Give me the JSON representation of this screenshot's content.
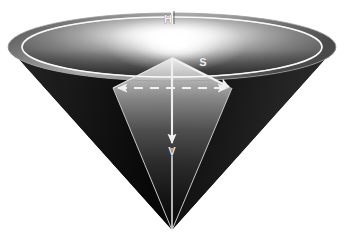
{
  "figure": {
    "background_color": "#ffffff",
    "width": 347,
    "height": 242
  },
  "labels": {
    "height_label": "H",
    "slant_label": "S",
    "vertical_label": "V"
  },
  "annotations": [
    {
      "name": "rim-diameter-marker",
      "label": "H",
      "kind": "tick-mark",
      "x": 172,
      "y": 20
    },
    {
      "name": "slant-arrow",
      "label": "S",
      "kind": "arrow",
      "from": [
        172,
        58
      ],
      "to": [
        232,
        88
      ]
    },
    {
      "name": "axis-arrow",
      "label": "V",
      "kind": "arrow",
      "from": [
        172,
        58
      ],
      "to": [
        172,
        148
      ]
    },
    {
      "name": "radius-dashed-line",
      "label": "",
      "kind": "dashed-double-arrow",
      "from": [
        113,
        88
      ],
      "to": [
        232,
        88
      ]
    }
  ],
  "geometry": {
    "rim_center": [
      172,
      47
    ],
    "rim_radius_x": 164,
    "rim_radius_y": 34,
    "inner_rim_radius_x": 148,
    "inner_rim_radius_y": 30,
    "apex": [
      172,
      230
    ],
    "inner_apex": [
      172,
      58
    ],
    "left_vertex": [
      113,
      88
    ],
    "right_vertex": [
      232,
      88
    ]
  },
  "colors": {
    "highlight": "#ffffff",
    "mid_gray": "#8a8a8a",
    "dark_gray": "#3a3a3a",
    "shadow": "#0a0a0a",
    "rim_line": "#f5f5f5",
    "background": "#ffffff"
  }
}
